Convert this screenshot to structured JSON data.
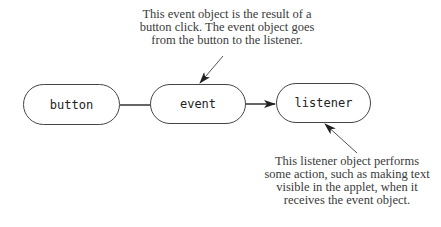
{
  "diagram": {
    "nodes": [
      {
        "id": "button",
        "label": "button"
      },
      {
        "id": "event",
        "label": "event"
      },
      {
        "id": "listener",
        "label": "listener"
      }
    ],
    "edges": [
      {
        "from": "button",
        "to": "event",
        "style": "line"
      },
      {
        "from": "event",
        "to": "listener",
        "style": "arrow"
      }
    ],
    "annotations": {
      "top": {
        "target": "event",
        "lines": [
          "This event object is the result of a",
          "button click. The event object goes",
          "from the button to the listener."
        ]
      },
      "bottom": {
        "target": "listener",
        "lines": [
          "This listener object performs",
          "some action, such as making text",
          "visible in the applet, when it",
          "receives the event object."
        ]
      }
    }
  }
}
